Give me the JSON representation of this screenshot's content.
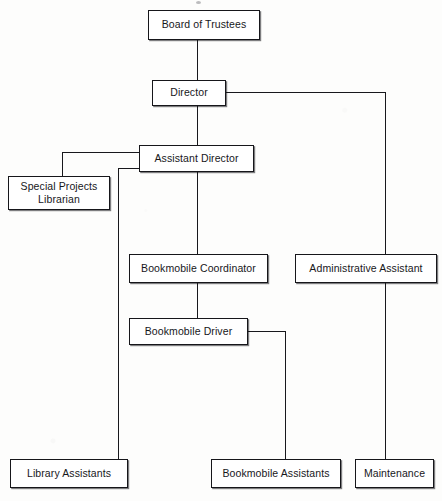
{
  "document": {
    "kind": "organizational-chart",
    "subject": "Public library staff hierarchy",
    "background_color": "#fdfdfc",
    "line_color": "#18181c",
    "box_fill": "#ffffff",
    "text_color": "#17171b"
  },
  "nodes": {
    "board_of_trustees": {
      "label": "Board of Trustees",
      "level": 1
    },
    "director": {
      "label": "Director",
      "level": 2
    },
    "assistant_director": {
      "label": "Assistant Director",
      "level": 3
    },
    "special_projects_librarian": {
      "label": "Special Projects\nLibrarian",
      "level": 4
    },
    "bookmobile_coordinator": {
      "label": "Bookmobile Coordinator",
      "level": 4
    },
    "administrative_assistant": {
      "label": "Administrative Assistant",
      "level": 4
    },
    "bookmobile_driver": {
      "label": "Bookmobile Driver",
      "level": 5
    },
    "library_assistants": {
      "label": "Library Assistants",
      "level": 6
    },
    "bookmobile_assistants": {
      "label": "Bookmobile Assistants",
      "level": 6
    },
    "maintenance": {
      "label": "Maintenance",
      "level": 6
    }
  },
  "relationships": [
    {
      "from": "board_of_trustees",
      "to": "director"
    },
    {
      "from": "director",
      "to": "assistant_director"
    },
    {
      "from": "director",
      "to": "administrative_assistant"
    },
    {
      "from": "assistant_director",
      "to": "special_projects_librarian"
    },
    {
      "from": "assistant_director",
      "to": "bookmobile_coordinator"
    },
    {
      "from": "assistant_director",
      "to": "library_assistants"
    },
    {
      "from": "bookmobile_coordinator",
      "to": "bookmobile_driver"
    },
    {
      "from": "bookmobile_driver",
      "to": "bookmobile_assistants"
    },
    {
      "from": "administrative_assistant",
      "to": "maintenance"
    }
  ]
}
